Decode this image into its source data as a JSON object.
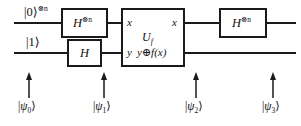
{
  "diagram": {
    "type": "quantum-circuit",
    "stroke_color": "#1a1a1a",
    "background_color": "#ffffff"
  },
  "wires": [
    {
      "id": "top",
      "input_label": "|0⟩",
      "input_superscript": "⊗n"
    },
    {
      "id": "bottom",
      "input_label": "|1⟩",
      "input_superscript": ""
    }
  ],
  "gates": [
    {
      "id": "h-top-left",
      "label": "H",
      "superscript": "⊗n",
      "wire": "top",
      "stage": 1
    },
    {
      "id": "h-bottom-left",
      "label": "H",
      "superscript": "",
      "wire": "bottom",
      "stage": 1
    },
    {
      "id": "uf",
      "label": "U",
      "subscript": "f",
      "wire": "both",
      "stage": 2,
      "ports": {
        "in_top": "x",
        "in_bottom": "y",
        "out_top": "x",
        "out_bottom": "y⊕f(x)"
      }
    },
    {
      "id": "h-top-right",
      "label": "H",
      "superscript": "⊗n",
      "wire": "top",
      "stage": 3
    }
  ],
  "state_markers": [
    {
      "id": "psi0",
      "ket_open": "|",
      "psi": "ψ",
      "sub": "0",
      "ket_close": "⟩"
    },
    {
      "id": "psi1",
      "ket_open": "|",
      "psi": "ψ",
      "sub": "1",
      "ket_close": "⟩"
    },
    {
      "id": "psi2",
      "ket_open": "|",
      "psi": "ψ",
      "sub": "2",
      "ket_close": "⟩"
    },
    {
      "id": "psi3",
      "ket_open": "|",
      "psi": "ψ",
      "sub": "3",
      "ket_close": "⟩"
    }
  ]
}
